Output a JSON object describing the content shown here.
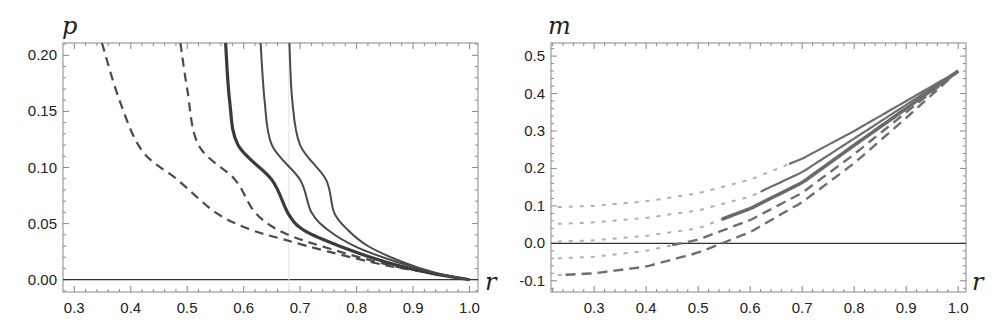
{
  "chart_data": [
    {
      "type": "line",
      "title": "",
      "xlabel": "r",
      "ylabel": "p",
      "xlim": [
        0.28,
        1.015
      ],
      "ylim": [
        -0.011,
        0.211
      ],
      "xticks": [
        "0.3",
        "0.4",
        "0.5",
        "0.6",
        "0.7",
        "0.8",
        "0.9",
        "1.0"
      ],
      "yticks": [
        "0.00",
        "0.05",
        "0.10",
        "0.15",
        "0.20"
      ],
      "grid": false,
      "legend": null,
      "reference_lines": [
        {
          "type": "horizontal",
          "y": 0.0
        },
        {
          "type": "vertical",
          "x": 0.68,
          "style": "faint"
        }
      ],
      "series": [
        {
          "name": "dashed-1",
          "style": "dashed",
          "points": [
            [
              0.349,
              0.211
            ],
            [
              0.38,
              0.16
            ],
            [
              0.42,
              0.115
            ],
            [
              0.483,
              0.089
            ],
            [
              0.55,
              0.06
            ],
            [
              0.61,
              0.045
            ],
            [
              0.67,
              0.036
            ],
            [
              0.75,
              0.025
            ],
            [
              0.85,
              0.013
            ],
            [
              0.93,
              0.006
            ],
            [
              1.0,
              0.0
            ]
          ]
        },
        {
          "name": "dashed-2",
          "style": "dashed",
          "points": [
            [
              0.488,
              0.211
            ],
            [
              0.5,
              0.17
            ],
            [
              0.52,
              0.12
            ],
            [
              0.585,
              0.089
            ],
            [
              0.62,
              0.06
            ],
            [
              0.67,
              0.042
            ],
            [
              0.75,
              0.028
            ],
            [
              0.85,
              0.014
            ],
            [
              0.93,
              0.006
            ],
            [
              1.0,
              0.0
            ]
          ]
        },
        {
          "name": "solid-thick",
          "style": "solid-thick",
          "points": [
            [
              0.568,
              0.211
            ],
            [
              0.575,
              0.16
            ],
            [
              0.59,
              0.12
            ],
            [
              0.65,
              0.089
            ],
            [
              0.68,
              0.058
            ],
            [
              0.71,
              0.043
            ],
            [
              0.78,
              0.028
            ],
            [
              0.85,
              0.016
            ],
            [
              0.93,
              0.006
            ],
            [
              1.0,
              0.0
            ]
          ]
        },
        {
          "name": "solid-2",
          "style": "solid",
          "points": [
            [
              0.63,
              0.211
            ],
            [
              0.637,
              0.16
            ],
            [
              0.65,
              0.12
            ],
            [
              0.7,
              0.089
            ],
            [
              0.72,
              0.06
            ],
            [
              0.75,
              0.044
            ],
            [
              0.8,
              0.029
            ],
            [
              0.87,
              0.016
            ],
            [
              0.94,
              0.006
            ],
            [
              1.0,
              0.0
            ]
          ]
        },
        {
          "name": "solid-3",
          "style": "solid",
          "points": [
            [
              0.681,
              0.211
            ],
            [
              0.686,
              0.16
            ],
            [
              0.7,
              0.12
            ],
            [
              0.746,
              0.089
            ],
            [
              0.76,
              0.06
            ],
            [
              0.785,
              0.044
            ],
            [
              0.82,
              0.03
            ],
            [
              0.88,
              0.016
            ],
            [
              0.94,
              0.006
            ],
            [
              1.0,
              0.0
            ]
          ]
        }
      ]
    },
    {
      "type": "line",
      "title": "",
      "xlabel": "r",
      "ylabel": "m",
      "xlim": [
        0.217,
        1.015
      ],
      "ylim": [
        -0.13,
        0.535
      ],
      "xticks": [
        "0.3",
        "0.4",
        "0.5",
        "0.6",
        "0.7",
        "0.8",
        "0.9",
        "1.0"
      ],
      "yticks": [
        "-0.1",
        "0.0",
        "0.1",
        "0.2",
        "0.3",
        "0.4",
        "0.5"
      ],
      "grid": false,
      "legend": null,
      "reference_lines": [
        {
          "type": "horizontal",
          "y": 0.0
        }
      ],
      "series": [
        {
          "name": "curve-1",
          "dotted_until_r": 0.675,
          "after_style": "solid",
          "points": [
            [
              0.23,
              0.097
            ],
            [
              0.3,
              0.1
            ],
            [
              0.4,
              0.112
            ],
            [
              0.5,
              0.134
            ],
            [
              0.6,
              0.17
            ],
            [
              0.7,
              0.226
            ],
            [
              0.8,
              0.3
            ],
            [
              0.9,
              0.38
            ],
            [
              1.0,
              0.46
            ]
          ]
        },
        {
          "name": "curve-2",
          "dotted_until_r": 0.62,
          "after_style": "solid",
          "points": [
            [
              0.23,
              0.052
            ],
            [
              0.3,
              0.056
            ],
            [
              0.4,
              0.068
            ],
            [
              0.5,
              0.088
            ],
            [
              0.6,
              0.125
            ],
            [
              0.7,
              0.19
            ],
            [
              0.8,
              0.28
            ],
            [
              0.9,
              0.37
            ],
            [
              1.0,
              0.46
            ]
          ]
        },
        {
          "name": "curve-3",
          "dotted_until_r": 0.545,
          "after_style": "solid-thick",
          "points": [
            [
              0.23,
              0.005
            ],
            [
              0.3,
              0.008
            ],
            [
              0.4,
              0.02
            ],
            [
              0.5,
              0.04
            ],
            [
              0.6,
              0.093
            ],
            [
              0.7,
              0.162
            ],
            [
              0.8,
              0.262
            ],
            [
              0.9,
              0.36
            ],
            [
              1.0,
              0.46
            ]
          ]
        },
        {
          "name": "curve-4",
          "dotted_until_r": 0.45,
          "after_style": "dashed",
          "points": [
            [
              0.23,
              -0.04
            ],
            [
              0.3,
              -0.036
            ],
            [
              0.4,
              -0.02
            ],
            [
              0.5,
              0.01
            ],
            [
              0.6,
              0.062
            ],
            [
              0.7,
              0.135
            ],
            [
              0.8,
              0.238
            ],
            [
              0.9,
              0.35
            ],
            [
              1.0,
              0.46
            ]
          ]
        },
        {
          "name": "curve-5",
          "dotted_until_r": 0.245,
          "after_style": "dashed",
          "points": [
            [
              0.23,
              -0.085
            ],
            [
              0.3,
              -0.08
            ],
            [
              0.4,
              -0.062
            ],
            [
              0.5,
              -0.025
            ],
            [
              0.6,
              0.03
            ],
            [
              0.7,
              0.11
            ],
            [
              0.8,
              0.214
            ],
            [
              0.9,
              0.335
            ],
            [
              1.0,
              0.46
            ]
          ]
        }
      ]
    }
  ],
  "panels": {
    "left": {
      "ylabel": "p",
      "xlabel": "r"
    },
    "right": {
      "ylabel": "m",
      "xlabel": "r"
    }
  }
}
